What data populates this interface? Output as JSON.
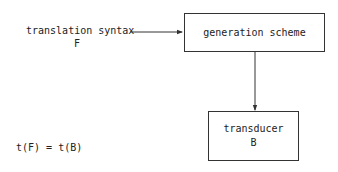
{
  "diagram": {
    "input": {
      "label": "translation syntax",
      "symbol": "F"
    },
    "generation_box": {
      "label": "generation scheme"
    },
    "transducer_box": {
      "label": "transducer",
      "symbol": "B"
    },
    "equation": "t(F) = t(B)",
    "colors": {
      "line": "#333333",
      "text": "#222222",
      "background": "#ffffff"
    }
  }
}
